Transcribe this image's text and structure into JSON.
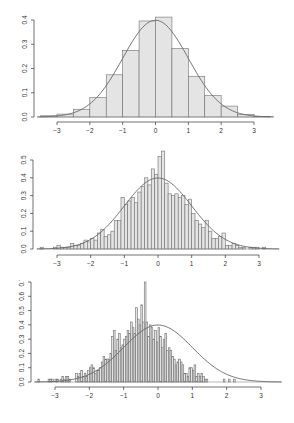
{
  "colors": {
    "bar_fill": "#e4e4e4",
    "bar_stroke": "#707070",
    "curve": "#666666",
    "axis": "#333333"
  },
  "chart_data": [
    {
      "type": "bar",
      "title": "",
      "xlabel": "",
      "ylabel": "",
      "bin_start": -3.5,
      "bin_width": 0.5,
      "values": [
        0.005,
        0.012,
        0.032,
        0.08,
        0.174,
        0.275,
        0.396,
        0.412,
        0.282,
        0.168,
        0.088,
        0.045,
        0.01,
        0.002
      ],
      "overlay": "normal density curve (mean 0, sd 1)",
      "xlim": [
        -3.6,
        3.6
      ],
      "ylim": [
        0,
        0.4
      ],
      "xticks": [
        "-3",
        "-2",
        "-1",
        "0",
        "1",
        "2",
        "3"
      ],
      "yticks": [
        "0.0",
        "0.1",
        "0.2",
        "0.3",
        "0.4"
      ],
      "grid": false
    },
    {
      "type": "bar",
      "title": "",
      "xlabel": "",
      "ylabel": "",
      "bin_start": -3.5,
      "bin_width": 0.1,
      "values": [
        0.01,
        0.0,
        0.0,
        0.0,
        0.01,
        0.02,
        0.01,
        0.01,
        0.01,
        0.03,
        0.02,
        0.02,
        0.03,
        0.05,
        0.04,
        0.06,
        0.05,
        0.09,
        0.11,
        0.07,
        0.08,
        0.1,
        0.16,
        0.16,
        0.29,
        0.25,
        0.27,
        0.29,
        0.26,
        0.32,
        0.35,
        0.4,
        0.36,
        0.45,
        0.42,
        0.52,
        0.55,
        0.37,
        0.31,
        0.3,
        0.31,
        0.29,
        0.3,
        0.25,
        0.28,
        0.2,
        0.16,
        0.14,
        0.12,
        0.16,
        0.1,
        0.06,
        0.06,
        0.07,
        0.09,
        0.02,
        0.02,
        0.03,
        0.02,
        0.01,
        0.01,
        0.0,
        0.01,
        0.01,
        0.01,
        0.0,
        0.01
      ],
      "overlay": "normal density curve (mean 0, sd 1)",
      "xlim": [
        -3.6,
        3.6
      ],
      "ylim": [
        0,
        0.5
      ],
      "xticks": [
        "-3",
        "-2",
        "-1",
        "0",
        "1",
        "2",
        "3"
      ],
      "yticks": [
        "0.0",
        "0.1",
        "0.2",
        "0.3",
        "0.4",
        "0.5"
      ],
      "grid": false
    },
    {
      "type": "bar",
      "title": "",
      "xlabel": "",
      "ylabel": "",
      "bin_start": -3.5,
      "bin_width": 0.05,
      "values": [
        0.02,
        0.0,
        0.0,
        0.0,
        0.0,
        0.0,
        0.02,
        0.02,
        0.02,
        0.0,
        0.02,
        0.02,
        0.0,
        0.02,
        0.04,
        0.02,
        0.04,
        0.04,
        0.02,
        0.0,
        0.0,
        0.0,
        0.06,
        0.04,
        0.06,
        0.08,
        0.04,
        0.06,
        0.04,
        0.08,
        0.1,
        0.12,
        0.1,
        0.06,
        0.08,
        0.08,
        0.1,
        0.14,
        0.18,
        0.16,
        0.16,
        0.16,
        0.2,
        0.32,
        0.36,
        0.22,
        0.3,
        0.34,
        0.24,
        0.26,
        0.3,
        0.32,
        0.36,
        0.34,
        0.42,
        0.38,
        0.34,
        0.52,
        0.44,
        0.4,
        0.54,
        0.42,
        0.7,
        0.42,
        0.32,
        0.4,
        0.38,
        0.3,
        0.36,
        0.28,
        0.38,
        0.32,
        0.24,
        0.3,
        0.34,
        0.22,
        0.24,
        0.22,
        0.18,
        0.16,
        0.12,
        0.14,
        0.16,
        0.14,
        0.12,
        0.06,
        0.06,
        0.04,
        0.1,
        0.1,
        0.08,
        0.12,
        0.04,
        0.06,
        0.04,
        0.06,
        0.04,
        0.02,
        0.02,
        0.0,
        0.0,
        0.0,
        0.0,
        0.0,
        0.0,
        0.0,
        0.0,
        0.0,
        0.02,
        0.0,
        0.0,
        0.02,
        0.0,
        0.0,
        0.02
      ],
      "overlay": "normal density curve (mean 0, sd 1)",
      "xlim": [
        -3.6,
        3.6
      ],
      "ylim": [
        0,
        0.7
      ],
      "xticks": [
        "-3",
        "-2",
        "-1",
        "0",
        "1",
        "2",
        "3"
      ],
      "yticks": [
        "0.0",
        "0.1",
        "0.2",
        "0.3",
        "0.4",
        "0.5",
        "0.6",
        "0.7"
      ],
      "grid": false
    }
  ]
}
